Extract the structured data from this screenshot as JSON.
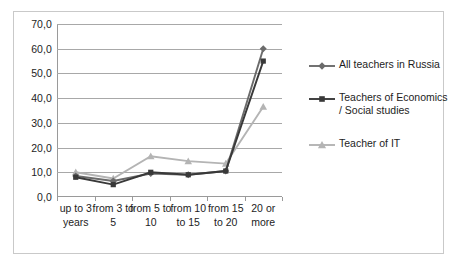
{
  "chart_data": {
    "type": "line",
    "title": "",
    "xlabel": "",
    "ylabel": "",
    "ylim": [
      0,
      70
    ],
    "ytick_step": 10,
    "grid": true,
    "legend_position": "right",
    "decimal_separator": ",",
    "categories": [
      "up to 3 years",
      "from 3 to 5",
      "from 5 to 10",
      "from 10 to 15",
      "from 15 to 20",
      "20 or more"
    ],
    "ytick_labels": [
      "0,0",
      "10,0",
      "20,0",
      "30,0",
      "40,0",
      "50,0",
      "60,0",
      "70,0"
    ],
    "ytick_values": [
      0,
      10,
      20,
      30,
      40,
      50,
      60,
      70
    ],
    "series": [
      {
        "name": "All teachers in Russia",
        "marker": "diamond",
        "color": "#6b6b6b",
        "values": [
          8.5,
          6.5,
          9.5,
          9.0,
          10.5,
          60.0
        ]
      },
      {
        "name": "Teachers of Economics / Social studies",
        "marker": "square",
        "color": "#393939",
        "values": [
          8.0,
          5.0,
          10.0,
          9.0,
          10.5,
          55.0
        ]
      },
      {
        "name": "Teacher of IT",
        "marker": "triangle",
        "color": "#b4b4b4",
        "values": [
          10.0,
          7.5,
          16.5,
          14.5,
          13.5,
          36.5
        ]
      }
    ]
  },
  "legend": {
    "items": [
      {
        "label": "All teachers in Russia"
      },
      {
        "label": "Teachers of Economics / Social studies"
      },
      {
        "label": "Teacher of IT"
      }
    ]
  }
}
